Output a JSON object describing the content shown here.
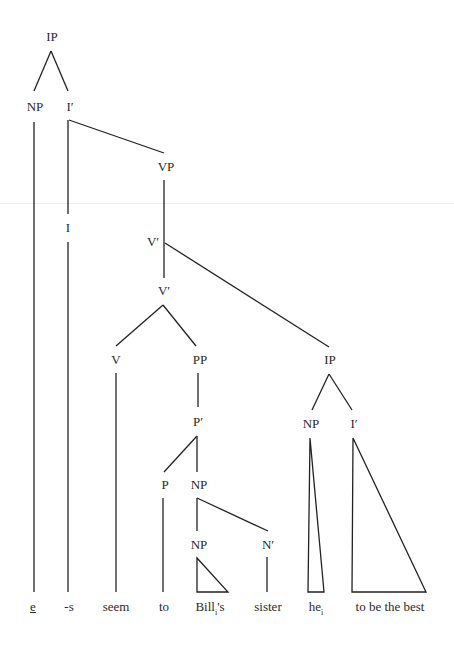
{
  "diagram": {
    "type": "syntax-tree",
    "nodes": {
      "ip_root": "IP",
      "np_subj": "NP",
      "ibar_main": "I′",
      "i_head": "I",
      "vp": "VP",
      "vbar_upper": "V′",
      "vbar_lower": "V′",
      "v": "V",
      "pp": "PP",
      "pbar": "P′",
      "p": "P",
      "np_obj": "NP",
      "np_poss": "NP",
      "nbar": "N′",
      "ip_embedded": "IP",
      "np_embedded": "NP",
      "ibar_embedded": "I′"
    },
    "words": {
      "empty": "e",
      "suffix": "-s",
      "verb": "seem",
      "prep": "to",
      "possessor": "Bill",
      "possessor_index": "i",
      "possessor_suffix": "'s",
      "noun": "sister",
      "pronoun": "he",
      "pronoun_index": "i",
      "infinitive": "to be the best"
    },
    "colors": {
      "line": "#222222",
      "text": "#2a2a2a",
      "background": "#ffffff"
    }
  }
}
